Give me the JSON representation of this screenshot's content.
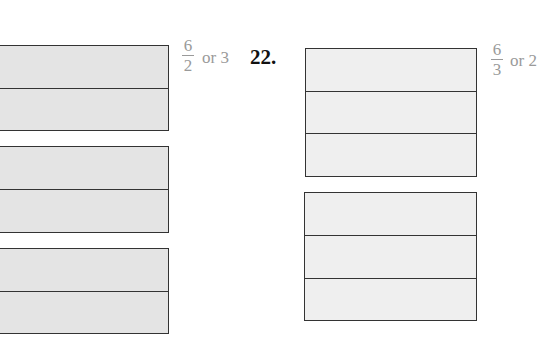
{
  "problem_21": {
    "answer": {
      "numerator": "6",
      "denominator": "2",
      "or_text": "or 3"
    },
    "shading": "#e4e4e4",
    "boxes": [
      {
        "parts": 2
      },
      {
        "parts": 2
      },
      {
        "parts": 2
      }
    ]
  },
  "problem_22": {
    "label": "22.",
    "answer": {
      "numerator": "6",
      "denominator": "3",
      "or_text": "or 2"
    },
    "shading": "#efefef",
    "boxes": [
      {
        "parts": 3
      },
      {
        "parts": 3
      }
    ]
  }
}
